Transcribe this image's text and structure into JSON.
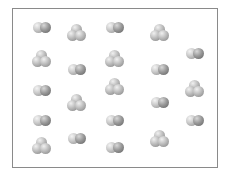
{
  "diagram": {
    "title": "",
    "container": {
      "border_color": "#8a8a8a",
      "background": "#ffffff"
    },
    "legend": [],
    "molecule_types": {
      "diatomic": {
        "atoms": 2,
        "description": "two bonded spheres side by side"
      },
      "triatomic": {
        "atoms": 3,
        "description": "three bonded spheres in triangular cluster"
      }
    },
    "molecules": [
      {
        "type": "diatomic",
        "x": 42,
        "y": 27
      },
      {
        "type": "triatomic",
        "x": 42,
        "y": 60
      },
      {
        "type": "diatomic",
        "x": 42,
        "y": 90
      },
      {
        "type": "diatomic",
        "x": 42,
        "y": 120
      },
      {
        "type": "triatomic",
        "x": 42,
        "y": 147
      },
      {
        "type": "triatomic",
        "x": 77,
        "y": 34
      },
      {
        "type": "diatomic",
        "x": 77,
        "y": 69
      },
      {
        "type": "triatomic",
        "x": 77,
        "y": 104
      },
      {
        "type": "diatomic",
        "x": 77,
        "y": 138
      },
      {
        "type": "diatomic",
        "x": 115,
        "y": 27
      },
      {
        "type": "triatomic",
        "x": 115,
        "y": 60
      },
      {
        "type": "triatomic",
        "x": 115,
        "y": 88
      },
      {
        "type": "diatomic",
        "x": 115,
        "y": 120
      },
      {
        "type": "diatomic",
        "x": 115,
        "y": 147
      },
      {
        "type": "triatomic",
        "x": 160,
        "y": 34
      },
      {
        "type": "diatomic",
        "x": 160,
        "y": 69
      },
      {
        "type": "diatomic",
        "x": 160,
        "y": 102
      },
      {
        "type": "triatomic",
        "x": 160,
        "y": 140
      },
      {
        "type": "diatomic",
        "x": 195,
        "y": 53
      },
      {
        "type": "triatomic",
        "x": 195,
        "y": 90
      },
      {
        "type": "diatomic",
        "x": 195,
        "y": 120
      }
    ],
    "counts": {
      "diatomic": 12,
      "triatomic": 9,
      "total": 21
    }
  }
}
